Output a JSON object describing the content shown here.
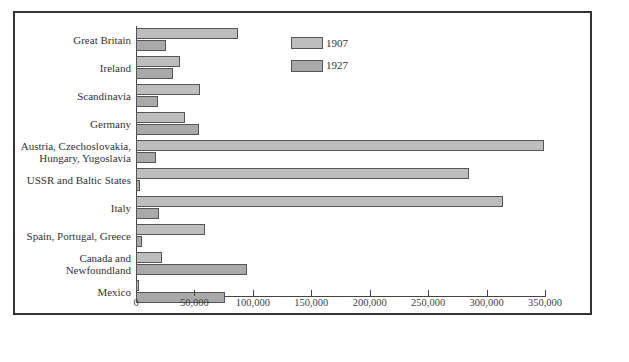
{
  "chart_data": {
    "type": "bar",
    "orientation": "horizontal",
    "title": "",
    "xlabel": "",
    "ylabel": "",
    "xlim": [
      0,
      350000
    ],
    "x_ticks": [
      "0",
      "50,000",
      "100,000",
      "150,000",
      "200,000",
      "250,000",
      "300,000",
      "350,000"
    ],
    "x_tick_values": [
      0,
      50000,
      100000,
      150000,
      200000,
      250000,
      300000,
      350000
    ],
    "grid": false,
    "legend_position": "upper-center",
    "categories": [
      "Great Britain",
      "Ireland",
      "Scandinavia",
      "Germany",
      "Austria, Czechoslovakia, Hungary, Yugoslavia",
      "USSR and Baltic States",
      "Italy",
      "Spain, Portugal, Greece",
      "Canada and Newfoundland",
      "Mexico"
    ],
    "category_lines": [
      [
        "Great Britain"
      ],
      [
        "Ireland"
      ],
      [
        "Scandinavia"
      ],
      [
        "Germany"
      ],
      [
        "Austria, Czechoslovakia,",
        "Hungary, Yugoslavia"
      ],
      [
        "USSR and Baltic States"
      ],
      [
        "Italy"
      ],
      [
        "Spain, Portugal, Greece"
      ],
      [
        "Canada and",
        "Newfoundland"
      ],
      [
        "Mexico"
      ]
    ],
    "series": [
      {
        "name": "1907",
        "color": "#bdbdbd",
        "values": [
          87000,
          38000,
          55000,
          42000,
          349000,
          285000,
          314000,
          59000,
          22000,
          2000
        ]
      },
      {
        "name": "1927",
        "color": "#a9a9a9",
        "values": [
          26000,
          32000,
          19000,
          54000,
          17000,
          3000,
          20000,
          5000,
          95000,
          76000
        ]
      }
    ]
  },
  "legend": [
    {
      "label": "1907"
    },
    {
      "label": "1927"
    }
  ]
}
